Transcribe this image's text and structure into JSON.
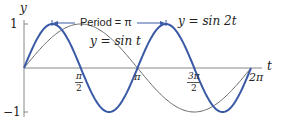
{
  "figure": {
    "y_axis_label": "y",
    "t_axis_label": "t",
    "y_ticks": [
      {
        "label": "1",
        "value": 1
      },
      {
        "label": "−1",
        "value": -1
      }
    ],
    "x_ticks": [
      {
        "num": "π",
        "den": "2"
      },
      {
        "label": "π"
      },
      {
        "num": "3π",
        "den": "2"
      },
      {
        "label": "2π"
      }
    ],
    "period_label": "Period = π",
    "curve_labels": {
      "sin_t": "y = sin t",
      "sin_2t": "y = sin 2t"
    },
    "colors": {
      "sin_2t": "#3a5aa6",
      "sin_t": "#666666",
      "axis": "#888888",
      "period_arrow": "#3a5aa6"
    }
  }
}
